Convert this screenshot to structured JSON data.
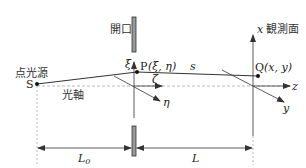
{
  "diagram": {
    "labels": {
      "aperture": "開口",
      "observation_plane": "観測面",
      "point_source": "点光源",
      "optical_axis": "光軸",
      "source_point": "S",
      "aperture_point": "P",
      "aperture_point_coords": "(ξ, η)",
      "observation_point": "Q",
      "observation_point_coords": "(x, y)",
      "path_length": "s",
      "xi_axis": "ξ",
      "zeta_axis": "ζ",
      "eta_axis": "η",
      "x_axis": "x",
      "y_axis": "y",
      "z_axis": "z",
      "distance_source_aperture": "L",
      "distance_source_aperture_sub": "0",
      "distance_aperture_screen": "L"
    },
    "colors": {
      "line": "#333333",
      "axis_dashed": "#aaaaaa",
      "aperture_fill": "#999999",
      "aperture_stroke": "#333333"
    }
  }
}
